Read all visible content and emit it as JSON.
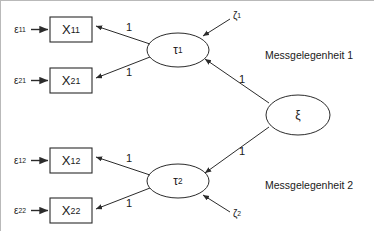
{
  "diagram": {
    "type": "structural-equation-model-path-diagram",
    "title_text": "",
    "background_color": "#ffffff",
    "line_color": "#2b2b2b",
    "text_color": "#1a1a1a"
  },
  "observed_variables": [
    {
      "id": "x11",
      "base": "X",
      "subscript": "11",
      "x": 50,
      "y": 17,
      "w": 42,
      "h": 25
    },
    {
      "id": "x21",
      "base": "X",
      "subscript": "21",
      "x": 50,
      "y": 68,
      "w": 42,
      "h": 25
    },
    {
      "id": "x12",
      "base": "X",
      "subscript": "12",
      "x": 50,
      "y": 148,
      "w": 42,
      "h": 25
    },
    {
      "id": "x22",
      "base": "X",
      "subscript": "22",
      "x": 50,
      "y": 198,
      "w": 42,
      "h": 25
    }
  ],
  "latent_variables": [
    {
      "id": "tau1",
      "base": "τ",
      "subscript": "1",
      "cx": 178,
      "cy": 50,
      "rx": 31,
      "ry": 17
    },
    {
      "id": "tau2",
      "base": "τ",
      "subscript": "2",
      "cx": 178,
      "cy": 181,
      "rx": 31,
      "ry": 17
    },
    {
      "id": "xi",
      "base": "ξ",
      "subscript": "",
      "cx": 298,
      "cy": 115,
      "rx": 32,
      "ry": 20
    }
  ],
  "error_terms": [
    {
      "id": "eps11",
      "base": "ε",
      "subscript": "11",
      "x": 10,
      "y": 22
    },
    {
      "id": "eps21",
      "base": "ε",
      "subscript": "21",
      "x": 10,
      "y": 73
    },
    {
      "id": "eps12",
      "base": "ε",
      "subscript": "12",
      "x": 10,
      "y": 153
    },
    {
      "id": "eps22",
      "base": "ε",
      "subscript": "22",
      "x": 10,
      "y": 203
    }
  ],
  "disturbance_terms": [
    {
      "id": "zeta1",
      "base": "ζ",
      "subscript": "1",
      "x": 228,
      "y": 8
    },
    {
      "id": "zeta2",
      "base": "ζ",
      "subscript": "2",
      "x": 228,
      "y": 206
    }
  ],
  "path_coefficients": [
    {
      "id": "coef-tau1-x11",
      "value": "1",
      "x": 128,
      "y": 24
    },
    {
      "id": "coef-tau1-x21",
      "value": "1",
      "x": 128,
      "y": 69
    },
    {
      "id": "coef-xi-tau1",
      "value": "1",
      "x": 240,
      "y": 76
    },
    {
      "id": "coef-xi-tau2",
      "value": "1",
      "x": 240,
      "y": 148
    },
    {
      "id": "coef-tau2-x12",
      "value": "1",
      "x": 128,
      "y": 155
    },
    {
      "id": "coef-tau2-x22",
      "value": "1",
      "x": 128,
      "y": 200
    }
  ],
  "group_labels": [
    {
      "id": "occasion-1",
      "text": "Messgelegenheit 1",
      "x": 265,
      "y": 48
    },
    {
      "id": "occasion-2",
      "text": "Messgelegenheit 2",
      "x": 265,
      "y": 178
    }
  ]
}
